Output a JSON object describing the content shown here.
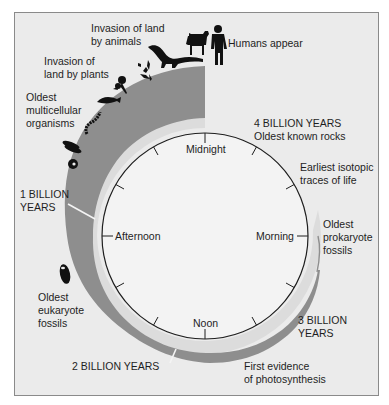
{
  "figure": {
    "type": "clock-timeline",
    "colors": {
      "background": "#ebebeb",
      "clock_face": "#f3f3f3",
      "light_ring": "#dcdcdc",
      "history_band": "#8e8e8e",
      "ink": "#1e1e1e"
    },
    "clock_labels": {
      "top": "Midnight",
      "right": "Morning",
      "bottom": "Noon",
      "left": "Afternoon"
    },
    "milestones": {
      "humans": "Humans appear",
      "animals": "Invasion of land\nby animals",
      "plants": "Invasion of\nland by plants",
      "multicellular": "Oldest\nmulticellular\norganisms",
      "one_billion": "1 BILLION\nYEARS",
      "eukaryote": "Oldest\neukaryote\nfossils",
      "two_billion": "2 BILLION YEARS",
      "photosynthesis": "First evidence\nof photosynthesis",
      "three_billion": "3 BILLION\nYEARS",
      "prokaryote": "Oldest\nprokaryote\nfossils",
      "isotopic": "Earliest isotopic\ntraces of life",
      "four_billion": "4 BILLION YEARS\nOldest known rocks"
    },
    "icons": [
      "human-silhouette",
      "dog-silhouette",
      "dinosaur-silhouette",
      "flowering-plant",
      "fern-plant",
      "fish",
      "worm",
      "trilobite-cluster",
      "jellyfish-disc",
      "eukaryote-cell"
    ]
  }
}
